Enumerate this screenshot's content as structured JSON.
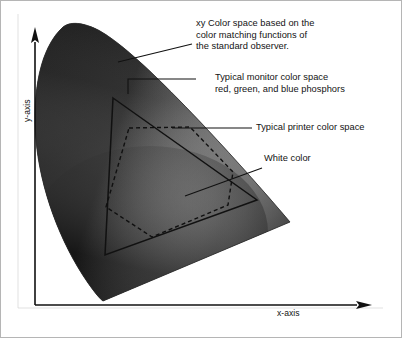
{
  "figure": {
    "axes": {
      "x_label": "x-axis",
      "y_label": "y-axis"
    },
    "annotations": [
      {
        "name": "xy-color-space",
        "lines": "xy Color space based on the\ncolor matching functions of\nthe standard observer."
      },
      {
        "name": "monitor-color-space",
        "lines": "Typical monitor color space\nred, green, and blue phosphors"
      },
      {
        "name": "printer-color-space",
        "lines": "Typical printer color space"
      },
      {
        "name": "white-color",
        "lines": "White color"
      }
    ],
    "colors": {
      "ink": "#131313",
      "background": "#ffffff",
      "gamut_dark": "#1b1b1b",
      "gamut_mid": "#6f6f6f",
      "gamut_light": "#ffffff",
      "frame": "#4a4a4a"
    },
    "shapes": {
      "monitor_gamut": "solid triangle",
      "printer_gamut": "dashed quadrilateral",
      "spectral_locus": "horseshoe chromaticity diagram"
    }
  }
}
